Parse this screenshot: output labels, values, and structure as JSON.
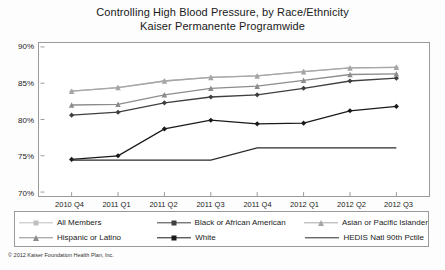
{
  "title": {
    "line1": "Controlling High Blood Pressure, by Race/Ethnicity",
    "line2": "Kaiser Permanente Programwide"
  },
  "footer": "© 2012 Kaiser Foundation Health Plan, Inc.",
  "colors": {
    "all_members": "#bfbfbf",
    "black_or_african_american": "#3f3f3f",
    "asian_or_pacific_islander": "#a6a6a6",
    "hispanic_or_latino": "#8c8c8c",
    "white": "#1a1a1a",
    "hedis": "#2b2b2b",
    "frame": "#9a9a9a",
    "text": "#1a1a1a"
  },
  "legend": {
    "row1": [
      {
        "label": "All Members",
        "marker": "diamond",
        "color": "#bfbfbf"
      },
      {
        "label": "Black or African American",
        "marker": "diamond",
        "color": "#3f3f3f"
      },
      {
        "label": "Asian or Pacific Islander",
        "marker": "triangle",
        "color": "#a6a6a6"
      }
    ],
    "row2": [
      {
        "label": "Hispanic or Latino",
        "marker": "triangle",
        "color": "#8c8c8c"
      },
      {
        "label": "White",
        "marker": "diamond",
        "color": "#1a1a1a"
      },
      {
        "label": "HEDIS Natl 90th Pctile",
        "marker": "none",
        "color": "#2b2b2b"
      }
    ]
  },
  "chart_data": {
    "type": "line",
    "title": "Controlling High Blood Pressure, by Race/Ethnicity\nKaiser Permanente Programwide",
    "xlabel": "",
    "ylabel": "",
    "categories": [
      "2010 Q4",
      "2011 Q1",
      "2011 Q2",
      "2011 Q3",
      "2011 Q4",
      "2012 Q1",
      "2012 Q2",
      "2012 Q3"
    ],
    "ylim": [
      70,
      90
    ],
    "yticks": [
      "70%",
      "75%",
      "80%",
      "85%",
      "90%"
    ],
    "grid": false,
    "legend_position": "bottom",
    "series": [
      {
        "name": "All Members",
        "color": "#bfbfbf",
        "marker": "diamond",
        "values": [
          83.9,
          84.4,
          85.3,
          85.8,
          86.0,
          86.6,
          87.1,
          87.2
        ]
      },
      {
        "name": "Black or African American",
        "color": "#3f3f3f",
        "marker": "diamond",
        "values": [
          80.6,
          81.0,
          82.3,
          83.1,
          83.4,
          84.3,
          85.3,
          85.7
        ]
      },
      {
        "name": "Asian or Pacific Islander",
        "color": "#a6a6a6",
        "marker": "triangle",
        "values": [
          83.9,
          84.4,
          85.3,
          85.8,
          86.0,
          86.6,
          87.1,
          87.2
        ]
      },
      {
        "name": "Hispanic or Latino",
        "color": "#8c8c8c",
        "marker": "triangle",
        "values": [
          82.0,
          82.1,
          83.4,
          84.3,
          84.6,
          85.4,
          86.2,
          86.3
        ]
      },
      {
        "name": "White",
        "color": "#1a1a1a",
        "marker": "diamond",
        "values": [
          74.5,
          75.0,
          78.7,
          79.9,
          79.4,
          79.5,
          81.2,
          81.8
        ]
      },
      {
        "name": "HEDIS Natl 90th Pctile",
        "color": "#2b2b2b",
        "marker": "none",
        "values": [
          74.4,
          74.4,
          74.4,
          74.4,
          76.1,
          76.1,
          76.1,
          76.1
        ]
      }
    ]
  }
}
